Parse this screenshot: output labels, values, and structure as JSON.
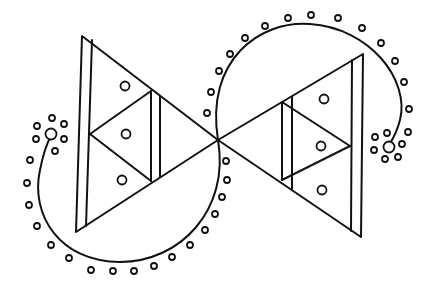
{
  "figure": {
    "colors": {
      "ink": "#111111",
      "background": "#ffffff"
    },
    "left_triangle": {
      "outer": [
        [
          82,
          36
        ],
        [
          76,
          232
        ],
        [
          218,
          140
        ]
      ],
      "inner_vertical": [
        [
          92,
          40
        ],
        [
          86,
          226
        ]
      ],
      "mid_vertex": [
        90,
        134
      ],
      "divider_pair": [
        [
          [
            151,
            91
          ],
          [
            151,
            181
          ]
        ],
        [
          [
            160,
            96
          ],
          [
            160,
            177
          ]
        ]
      ],
      "circles": [
        [
          125,
          86
        ],
        [
          126,
          134
        ],
        [
          122,
          180
        ]
      ]
    },
    "right_triangle": {
      "outer": [
        [
          363,
          54
        ],
        [
          361,
          237
        ],
        [
          218,
          140
        ]
      ],
      "inner_vertical": [
        [
          352,
          60
        ],
        [
          351,
          231
        ]
      ],
      "mid_vertex": [
        350,
        146
      ],
      "divider_pair": [
        [
          [
            282,
            102
          ],
          [
            282,
            180
          ]
        ],
        [
          [
            292,
            97
          ],
          [
            292,
            189
          ]
        ]
      ],
      "circles": [
        [
          324,
          99
        ],
        [
          321,
          146
        ],
        [
          322,
          190
        ]
      ]
    },
    "curves": {
      "upper_right": "M 218 140 C 205 60 260 20 310 24 C 370 28 410 80 400 120 C 396 135 392 140 389 145",
      "lower_left": "M 218 140 C 230 210 180 262 120 262 C 60 262 30 215 40 170 C 43 155 47 143 51 136"
    },
    "end_circles": [
      [
        51,
        134
      ],
      [
        389,
        147
      ]
    ],
    "dots": [
      [
        52,
        118
      ],
      [
        37,
        126
      ],
      [
        64,
        124
      ],
      [
        36,
        139
      ],
      [
        64,
        139
      ],
      [
        55,
        151
      ],
      [
        30,
        160
      ],
      [
        27,
        183
      ],
      [
        29,
        205
      ],
      [
        37,
        226
      ],
      [
        51,
        245
      ],
      [
        69,
        258
      ],
      [
        91,
        270
      ],
      [
        113,
        271
      ],
      [
        134,
        271
      ],
      [
        154,
        266
      ],
      [
        172,
        257
      ],
      [
        190,
        245
      ],
      [
        205,
        230
      ],
      [
        215,
        214
      ],
      [
        222,
        197
      ],
      [
        227,
        180
      ],
      [
        226,
        161
      ],
      [
        207,
        113
      ],
      [
        211,
        92
      ],
      [
        219,
        71
      ],
      [
        230,
        54
      ],
      [
        245,
        38
      ],
      [
        265,
        26
      ],
      [
        288,
        18
      ],
      [
        311,
        15
      ],
      [
        338,
        18
      ],
      [
        362,
        28
      ],
      [
        381,
        43
      ],
      [
        395,
        61
      ],
      [
        404,
        82
      ],
      [
        409,
        109
      ],
      [
        408,
        132
      ],
      [
        375,
        137
      ],
      [
        387,
        133
      ],
      [
        402,
        144
      ],
      [
        398,
        157
      ],
      [
        385,
        159
      ],
      [
        374,
        150
      ]
    ]
  }
}
